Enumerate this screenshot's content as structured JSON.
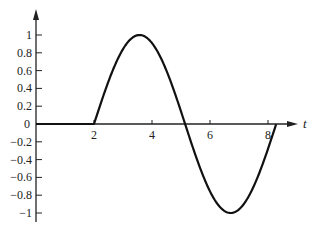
{
  "chart_data": {
    "type": "line",
    "title": "",
    "xlabel": "t",
    "ylabel": "",
    "xlim": [
      0,
      8.28
    ],
    "ylim": [
      -1,
      1
    ],
    "grid": false,
    "legend": null,
    "x_ticks": [
      2,
      4,
      6,
      8
    ],
    "y_ticks": [
      1,
      0.8,
      0.6,
      0.4,
      0.2,
      0,
      -0.2,
      -0.4,
      -0.6,
      -0.8,
      -1
    ],
    "x_tick_labels": [
      "2",
      "4",
      "6",
      "8"
    ],
    "y_tick_labels": [
      "1",
      "0.8",
      "0.6",
      "0.4",
      "0.2",
      "0",
      "-0.2",
      "-0.4",
      "-0.6",
      "-0.8",
      "-1"
    ],
    "series": [
      {
        "name": "f(t)",
        "description": "0 for t<2, sin(t-2) for 2<=t<=2+2π",
        "x": [
          0,
          1,
          2,
          2.5,
          3,
          3.57,
          4,
          4.5,
          5,
          5.14,
          5.5,
          6,
          6.5,
          6.71,
          7,
          7.5,
          8,
          8.28
        ],
        "values": [
          0,
          0,
          0,
          0.48,
          0.84,
          1.0,
          0.91,
          0.6,
          0.14,
          0,
          -0.35,
          -0.76,
          -0.98,
          -1.0,
          -0.96,
          -0.71,
          -0.28,
          0
        ]
      }
    ],
    "annotations": []
  },
  "axes": {
    "x_variable": "t"
  }
}
